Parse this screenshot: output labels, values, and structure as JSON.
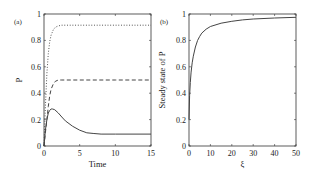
{
  "chart_data": [
    {
      "panel": "(a)",
      "type": "line",
      "xlabel": "Time",
      "ylabel": "P",
      "xlim": [
        0,
        15
      ],
      "ylim": [
        0,
        1
      ],
      "xticks": [
        "0",
        "5",
        "10",
        "15"
      ],
      "yticks": [
        "0",
        "0.2",
        "0.4",
        "0.6",
        "0.8",
        "1"
      ],
      "grid": false,
      "series": [
        {
          "name": "dotted",
          "style": "dotted",
          "x": [
            0,
            0.2,
            0.4,
            0.6,
            0.8,
            1.0,
            1.3,
            1.6,
            2.0,
            2.5,
            3,
            5,
            10,
            15
          ],
          "y": [
            0,
            0.3,
            0.55,
            0.7,
            0.79,
            0.84,
            0.88,
            0.9,
            0.91,
            0.915,
            0.915,
            0.915,
            0.915,
            0.915
          ]
        },
        {
          "name": "dashed",
          "style": "dashed",
          "x": [
            0,
            0.2,
            0.4,
            0.6,
            0.8,
            1.0,
            1.3,
            1.6,
            2.0,
            2.5,
            3,
            5,
            10,
            15
          ],
          "y": [
            0,
            0.1,
            0.2,
            0.3,
            0.38,
            0.43,
            0.47,
            0.49,
            0.5,
            0.5,
            0.5,
            0.5,
            0.5,
            0.5
          ]
        },
        {
          "name": "solid",
          "style": "solid",
          "x": [
            0,
            0.2,
            0.4,
            0.6,
            0.8,
            1.0,
            1.2,
            1.5,
            2,
            2.5,
            3,
            4,
            5,
            6,
            7,
            8,
            10,
            15
          ],
          "y": [
            0,
            0.12,
            0.2,
            0.25,
            0.27,
            0.28,
            0.28,
            0.275,
            0.25,
            0.22,
            0.19,
            0.15,
            0.12,
            0.1,
            0.095,
            0.09,
            0.09,
            0.09
          ]
        }
      ]
    },
    {
      "panel": "(b)",
      "type": "line",
      "xlabel": "ξ",
      "ylabel": "Steady state of P",
      "xlim": [
        0,
        50
      ],
      "ylim": [
        0,
        1
      ],
      "xticks": [
        "0",
        "10",
        "20",
        "30",
        "40",
        "50"
      ],
      "yticks": [
        "0",
        "0.2",
        "0.4",
        "0.6",
        "0.8",
        "1"
      ],
      "grid": false,
      "series": [
        {
          "name": "steady-state",
          "style": "solid",
          "x": [
            0,
            0.3,
            0.6,
            1,
            1.5,
            2,
            3,
            4,
            5,
            6,
            8,
            10,
            15,
            20,
            25,
            30,
            40,
            50
          ],
          "y": [
            0.2,
            0.38,
            0.48,
            0.56,
            0.63,
            0.68,
            0.75,
            0.8,
            0.83,
            0.855,
            0.885,
            0.905,
            0.93,
            0.945,
            0.955,
            0.962,
            0.97,
            0.975
          ]
        }
      ]
    }
  ],
  "labels": {
    "a_panel": "(a)",
    "b_panel": "(b)",
    "a_xlabel": "Time",
    "a_ylabel": "P",
    "b_xlabel": "ξ",
    "b_ylabel": "Steady state of P"
  }
}
